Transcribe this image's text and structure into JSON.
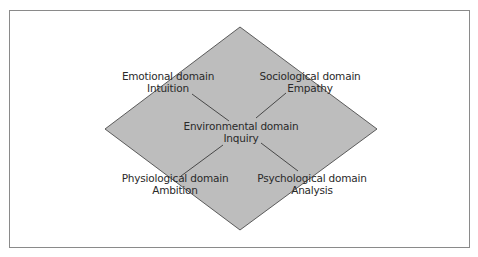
{
  "diagram": {
    "colors": {
      "fill": "#bdbdbd",
      "stroke": "#3a3a3a",
      "frame": "#8a8a8a",
      "text": "#2a2a2a"
    },
    "center": {
      "line1": "Environmental domain",
      "line2": "Inquiry"
    },
    "nodes": [
      {
        "id": "emotional",
        "line1": "Emotional domain",
        "line2": "Intuition",
        "position": "top-left"
      },
      {
        "id": "sociological",
        "line1": "Sociological domain",
        "line2": "Empathy",
        "position": "top-right"
      },
      {
        "id": "physiological",
        "line1": "Physiological domain",
        "line2": "Ambition",
        "position": "bottom-left"
      },
      {
        "id": "psychological",
        "line1": "Psychological domain",
        "line2": "Analysis",
        "position": "bottom-right"
      }
    ]
  }
}
